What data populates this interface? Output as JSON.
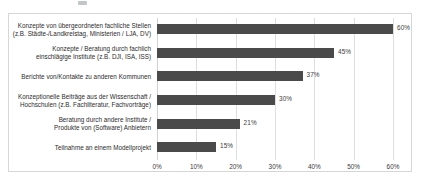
{
  "chart_data": {
    "type": "bar",
    "orientation": "horizontal",
    "title": "",
    "xlabel": "",
    "ylabel": "",
    "xlim": [
      0,
      60
    ],
    "grid": true,
    "legend": false,
    "xticks": [
      "0%",
      "10%",
      "20%",
      "30%",
      "40%",
      "50%",
      "60%"
    ],
    "xtick_values": [
      0,
      10,
      20,
      30,
      40,
      50,
      60
    ],
    "categories": [
      "Konzepte von übergeordneten fachliche Stellen\n(z.B. Städte-/Landkreistag, Ministerien / LJA, DV)",
      "Konzepte / Beratung durch fachlich\neinschlägige Institute (z.B. DJI, ISA, ISS)",
      "Berichte von/Kontakte zu anderen Kommunen",
      "Konzeptionelle Beiträge aus der Wissenschaft /\nHochschulen (z.B. Fachliteratur, Fachvorträge)",
      "Beratung durch andere Institute /\nProdukte von (Software) Anbietern",
      "Teilnahme an einem Modellprojekt"
    ],
    "values": [
      60,
      45,
      37,
      30,
      21,
      15
    ],
    "value_labels": [
      "60%",
      "45%",
      "37%",
      "30%",
      "21%",
      "15%"
    ],
    "bar_color": "#4a4a4a",
    "grid_color": "#dcdee0",
    "frame_color": "#d4d6d8",
    "background": "#ffffff"
  }
}
